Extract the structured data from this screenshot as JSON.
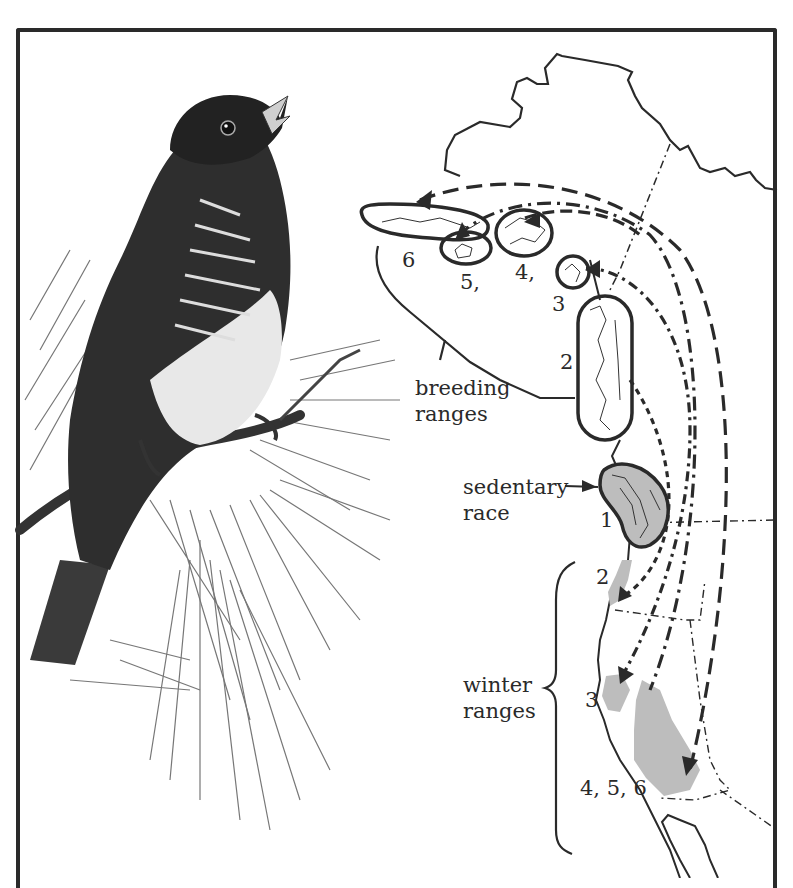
{
  "figure": {
    "colors": {
      "ink": "#2a2a2a",
      "range_fill": "#bdbdbd",
      "background": "#ffffff"
    }
  },
  "labels": {
    "breeding": "breeding",
    "breeding2": "ranges",
    "sedentary": "sedentary",
    "sedentary2": "race",
    "winter": "winter",
    "winter2": "ranges"
  },
  "breeding_numbers": {
    "n6": "6",
    "n5": "5,",
    "n4": "4,",
    "n3": "3",
    "n2": "2",
    "n1": "1"
  },
  "winter_numbers": {
    "w2": "2",
    "w3": "3",
    "w456": "4, 5, 6"
  }
}
